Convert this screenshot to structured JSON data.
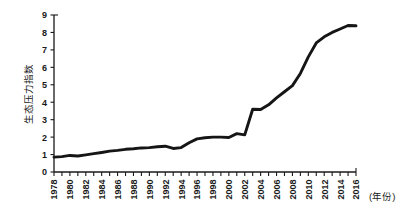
{
  "chart_data": {
    "type": "line",
    "title": "",
    "subtitle": "",
    "xlabel": "(年份)",
    "ylabel": "生态压力指数",
    "xlim": [
      1978,
      2016
    ],
    "ylim": [
      0,
      9
    ],
    "grid": false,
    "legend_position": "none",
    "legend": [],
    "annotations": [],
    "y_ticks": [
      0,
      1,
      2,
      3,
      4,
      5,
      6,
      7,
      8,
      9
    ],
    "y_tick_labels": [
      "0",
      "1",
      "2",
      "3",
      "4",
      "5",
      "6",
      "7",
      "8",
      "9"
    ],
    "x_tick_years": [
      1978,
      1979,
      1980,
      1981,
      1982,
      1983,
      1984,
      1985,
      1986,
      1987,
      1988,
      1989,
      1990,
      1991,
      1992,
      1993,
      1994,
      1995,
      1996,
      1997,
      1998,
      1999,
      2000,
      2001,
      2002,
      2003,
      2004,
      2005,
      2006,
      2007,
      2008,
      2009,
      2010,
      2011,
      2012,
      2013,
      2014,
      2015,
      2016
    ],
    "x_tick_labels_shown": [
      "1978",
      "1980",
      "1982",
      "1984",
      "1986",
      "1988",
      "1990",
      "1992",
      "1994",
      "1996",
      "1998",
      "2000",
      "2002",
      "2004",
      "2006",
      "2008",
      "2010",
      "2012",
      "2014",
      "2016"
    ],
    "series": [
      {
        "name": "生态压力指数",
        "color": "#151515",
        "x": [
          1978,
          1979,
          1980,
          1981,
          1982,
          1983,
          1984,
          1985,
          1986,
          1987,
          1988,
          1989,
          1990,
          1991,
          1992,
          1993,
          1994,
          1995,
          1996,
          1997,
          1998,
          1999,
          2000,
          2001,
          2002,
          2003,
          2004,
          2005,
          2006,
          2007,
          2008,
          2009,
          2010,
          2011,
          2012,
          2013,
          2014,
          2015,
          2016
        ],
        "values": [
          0.85,
          0.88,
          0.95,
          0.92,
          0.98,
          1.05,
          1.12,
          1.2,
          1.24,
          1.3,
          1.33,
          1.38,
          1.4,
          1.45,
          1.48,
          1.35,
          1.4,
          1.68,
          1.9,
          1.96,
          2.0,
          2.0,
          1.98,
          2.2,
          2.13,
          3.6,
          3.58,
          3.85,
          4.25,
          4.6,
          4.95,
          5.65,
          6.6,
          7.4,
          7.75,
          8.0,
          8.2,
          8.4,
          8.38
        ]
      }
    ]
  },
  "plot_geometry": {
    "left": 54,
    "right": 356,
    "top": 15,
    "bottom": 172
  }
}
